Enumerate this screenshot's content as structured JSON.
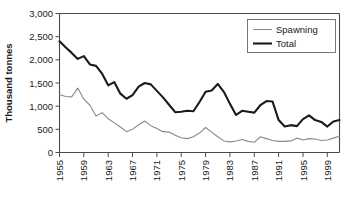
{
  "chart_data": {
    "type": "line",
    "title": "",
    "xlabel": "",
    "ylabel": "Thousand tonnes",
    "ylim": [
      0,
      3000
    ],
    "xlim": [
      1955,
      2001
    ],
    "grid": false,
    "legend_position": "top-right",
    "y_ticks": [
      0,
      500,
      1000,
      1500,
      2000,
      2500,
      3000
    ],
    "y_tick_labels": [
      "0",
      "500",
      "1,000",
      "1,500",
      "2,000",
      "2,500",
      "3,000"
    ],
    "x_tick_labels": [
      "1955",
      "1959",
      "1963",
      "1967",
      "1971",
      "1975",
      "1979",
      "1983",
      "1987",
      "1991",
      "1995",
      "1999"
    ],
    "x": [
      1955,
      1956,
      1957,
      1958,
      1959,
      1960,
      1961,
      1962,
      1963,
      1964,
      1965,
      1966,
      1967,
      1968,
      1969,
      1970,
      1971,
      1972,
      1973,
      1974,
      1975,
      1976,
      1977,
      1978,
      1979,
      1980,
      1981,
      1982,
      1983,
      1984,
      1985,
      1986,
      1987,
      1988,
      1989,
      1990,
      1991,
      1992,
      1993,
      1994,
      1995,
      1996,
      1997,
      1998,
      1999,
      2000,
      2001
    ],
    "series": [
      {
        "name": "Spawning",
        "color": "#8a8a8a",
        "line_width": 1.1,
        "values": [
          1250,
          1210,
          1200,
          1390,
          1150,
          1020,
          790,
          860,
          730,
          640,
          550,
          450,
          500,
          600,
          680,
          580,
          520,
          450,
          440,
          370,
          320,
          300,
          340,
          420,
          540,
          440,
          340,
          250,
          230,
          250,
          280,
          240,
          220,
          340,
          300,
          260,
          240,
          240,
          250,
          310,
          270,
          300,
          290,
          260,
          270,
          310,
          350
        ]
      },
      {
        "name": "Total",
        "color": "#1a1a1a",
        "line_width": 2.1,
        "values": [
          2400,
          2270,
          2150,
          2020,
          2080,
          1900,
          1870,
          1700,
          1450,
          1520,
          1270,
          1160,
          1240,
          1420,
          1500,
          1470,
          1330,
          1190,
          1030,
          870,
          880,
          900,
          890,
          1090,
          1310,
          1340,
          1480,
          1310,
          1050,
          810,
          900,
          880,
          860,
          1020,
          1110,
          1100,
          700,
          560,
          590,
          570,
          720,
          800,
          700,
          660,
          560,
          670,
          700
        ]
      }
    ]
  },
  "legend": {
    "entries": [
      {
        "label": "Spawning"
      },
      {
        "label": "Total"
      }
    ]
  }
}
